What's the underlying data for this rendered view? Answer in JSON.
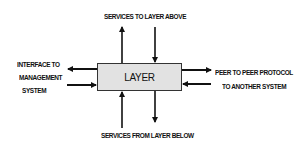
{
  "diagram": {
    "center_box": {
      "label": "LAYER",
      "fill": "#e2e2e2"
    },
    "labels": {
      "top": "SERVICES TO LAYER ABOVE",
      "bottom": "SERVICES  FROM LAYER BELOW",
      "left": [
        "INTERFACE TO",
        "MANAGEMENT",
        "SYSTEM"
      ],
      "right": [
        "PEER TO PEER PROTOCOL",
        "TO ANOTHER SYSTEM"
      ]
    },
    "arrows": [
      {
        "id": "top-up",
        "direction": "up",
        "from": "LAYER",
        "to": "SERVICES TO LAYER ABOVE"
      },
      {
        "id": "top-down",
        "direction": "down",
        "from": "SERVICES TO LAYER ABOVE",
        "to": "LAYER"
      },
      {
        "id": "left-out",
        "direction": "left",
        "from": "LAYER",
        "to": "INTERFACE TO MANAGEMENT SYSTEM"
      },
      {
        "id": "left-in",
        "direction": "right",
        "from": "INTERFACE TO MANAGEMENT SYSTEM",
        "to": "LAYER"
      },
      {
        "id": "right-out",
        "direction": "right",
        "from": "LAYER",
        "to": "PEER TO PEER PROTOCOL TO ANOTHER SYSTEM"
      },
      {
        "id": "right-in",
        "direction": "left",
        "from": "PEER TO PEER PROTOCOL TO ANOTHER SYSTEM",
        "to": "LAYER"
      },
      {
        "id": "bottom-up",
        "direction": "up",
        "from": "SERVICES FROM LAYER BELOW",
        "to": "LAYER"
      },
      {
        "id": "bottom-down",
        "direction": "down",
        "from": "LAYER",
        "to": "SERVICES FROM LAYER BELOW"
      }
    ],
    "colors": {
      "ink": "#111111",
      "box_fill": "#e2e2e2",
      "background": "#ffffff"
    }
  }
}
